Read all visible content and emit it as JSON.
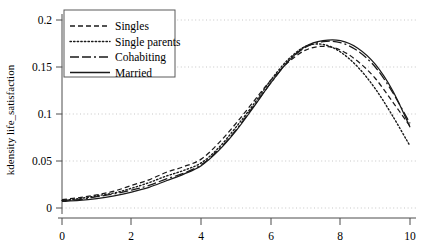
{
  "chart_data": {
    "type": "line",
    "title": "",
    "xlabel": "",
    "ylabel": "kdensity life_satisfaction",
    "xlim": [
      0,
      10
    ],
    "ylim": [
      0,
      0.2
    ],
    "xticks": [
      0,
      2,
      4,
      6,
      8,
      10
    ],
    "yticks": [
      0,
      0.05,
      0.1,
      0.15,
      0.2
    ],
    "xtick_labels": [
      "0",
      "2",
      "4",
      "6",
      "8",
      "10"
    ],
    "ytick_labels": [
      "0",
      "0.05",
      "0.1",
      "0.15",
      "0.2"
    ],
    "grid": "horizontal-dotted",
    "legend_position": "top-left",
    "x": [
      0,
      0.5,
      1,
      1.5,
      2,
      2.5,
      3,
      3.5,
      4,
      4.5,
      5,
      5.5,
      6,
      6.5,
      7,
      7.5,
      8,
      8.5,
      9,
      9.5,
      10
    ],
    "series": [
      {
        "name": "Singles",
        "style": "dashed",
        "color": "#1a1a1a",
        "values": [
          0.009,
          0.011,
          0.014,
          0.018,
          0.024,
          0.03,
          0.038,
          0.044,
          0.052,
          0.069,
          0.09,
          0.113,
          0.136,
          0.155,
          0.168,
          0.172,
          0.168,
          0.156,
          0.138,
          0.113,
          0.087
        ]
      },
      {
        "name": "Single parents",
        "style": "dotted",
        "color": "#1a1a1a",
        "values": [
          0.008,
          0.01,
          0.013,
          0.016,
          0.021,
          0.027,
          0.034,
          0.04,
          0.048,
          0.064,
          0.086,
          0.11,
          0.136,
          0.158,
          0.172,
          0.174,
          0.166,
          0.15,
          0.127,
          0.098,
          0.066
        ]
      },
      {
        "name": "Cohabiting",
        "style": "dashdot",
        "color": "#1a1a1a",
        "values": [
          0.008,
          0.009,
          0.012,
          0.015,
          0.019,
          0.024,
          0.031,
          0.037,
          0.046,
          0.062,
          0.083,
          0.108,
          0.133,
          0.156,
          0.171,
          0.177,
          0.176,
          0.167,
          0.15,
          0.123,
          0.09
        ]
      },
      {
        "name": "Married",
        "style": "solid",
        "color": "#1a1a1a",
        "values": [
          0.007,
          0.008,
          0.01,
          0.013,
          0.017,
          0.022,
          0.029,
          0.036,
          0.045,
          0.061,
          0.082,
          0.107,
          0.133,
          0.156,
          0.172,
          0.178,
          0.178,
          0.17,
          0.153,
          0.125,
          0.086
        ]
      }
    ]
  },
  "legend": {
    "items": [
      {
        "label": "Singles",
        "style": "dashed"
      },
      {
        "label": "Single parents",
        "style": "dotted"
      },
      {
        "label": "Cohabiting",
        "style": "dashdot"
      },
      {
        "label": "Married",
        "style": "solid"
      }
    ]
  },
  "axes": {
    "y_axis_label": "kdensity life_satisfaction"
  }
}
